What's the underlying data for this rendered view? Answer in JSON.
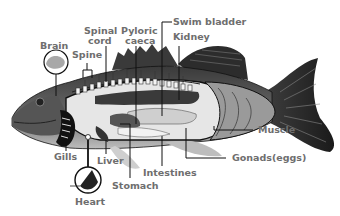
{
  "diagram": {
    "type": "labeled-anatomy",
    "labels": {
      "brain": "Brain",
      "spine": "Spine",
      "spinal_cord_1": "Spinal",
      "spinal_cord_2": "cord",
      "pyloric_1": "Pyloric",
      "pyloric_2": "caeca",
      "swim_bladder": "Swim bladder",
      "kidney": "Kidney",
      "muscle": "Muscle",
      "gonads": "Gonads(eggs)",
      "gills": "Gills",
      "liver": "Liver",
      "intestines": "Intestines",
      "stomach": "Stomach",
      "heart": "Heart"
    },
    "colors": {
      "label_text": "#6e6e6e",
      "outline": "#111111",
      "body_dark": "#2a2a2a",
      "cavity": "#e6e6e6",
      "muscle_gray": "#9a9a9a"
    }
  }
}
